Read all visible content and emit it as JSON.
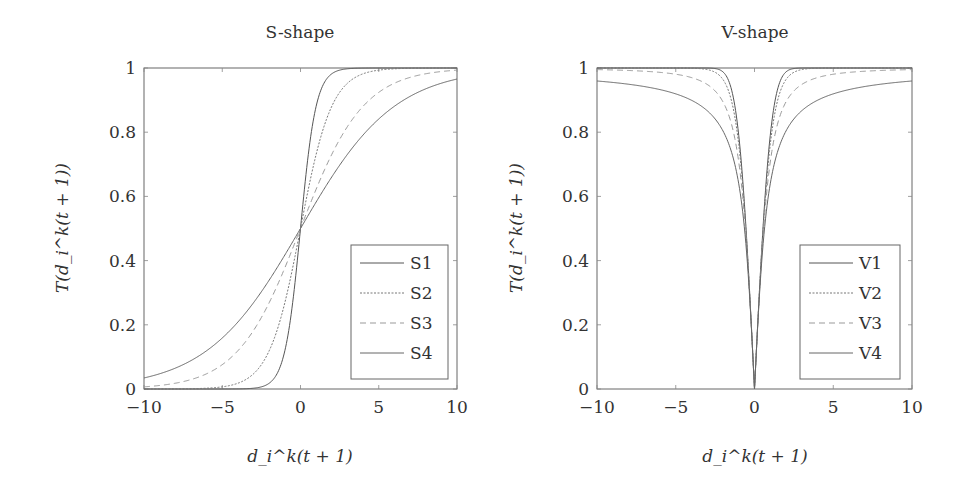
{
  "chart_data": [
    {
      "type": "line",
      "title": "S-shape",
      "xlabel": "d_i^k(t + 1)",
      "ylabel": "T(d_i^k(t + 1))",
      "xlim": [
        -10,
        10
      ],
      "ylim": [
        0,
        1
      ],
      "xticks": [
        -10,
        -5,
        0,
        5,
        10
      ],
      "yticks": [
        0,
        0.2,
        0.4,
        0.6,
        0.8,
        1
      ],
      "xtick_labels": [
        "−10",
        "−5",
        "0",
        "5",
        "10"
      ],
      "ytick_labels": [
        "0",
        "0.2",
        "0.4",
        "0.6",
        "0.8",
        "1"
      ],
      "grid": false,
      "legend_position": "lower right",
      "x": [
        -10,
        -8,
        -6,
        -5,
        -4,
        -3,
        -2,
        -1.5,
        -1,
        -0.5,
        0,
        0.5,
        1,
        1.5,
        2,
        3,
        4,
        5,
        6,
        8,
        10
      ],
      "series": [
        {
          "name": "S1",
          "values": [
            0.0,
            0.0,
            0.0,
            0.0,
            0.0003,
            0.0025,
            0.018,
            0.047,
            0.119,
            0.269,
            0.5,
            0.731,
            0.881,
            0.953,
            0.982,
            0.9975,
            0.9997,
            1.0,
            1.0,
            1.0,
            1.0
          ]
        },
        {
          "name": "S2",
          "values": [
            0.0,
            0.0003,
            0.0025,
            0.0067,
            0.018,
            0.047,
            0.119,
            0.182,
            0.269,
            0.378,
            0.5,
            0.622,
            0.731,
            0.818,
            0.881,
            0.953,
            0.982,
            0.9933,
            0.9975,
            0.9997,
            1.0
          ]
        },
        {
          "name": "S3",
          "values": [
            0.0067,
            0.018,
            0.047,
            0.076,
            0.119,
            0.182,
            0.269,
            0.321,
            0.378,
            0.438,
            0.5,
            0.562,
            0.622,
            0.679,
            0.731,
            0.818,
            0.881,
            0.924,
            0.953,
            0.982,
            0.9933
          ]
        },
        {
          "name": "S4",
          "values": [
            0.034,
            0.065,
            0.119,
            0.159,
            0.209,
            0.269,
            0.339,
            0.378,
            0.417,
            0.458,
            0.5,
            0.542,
            0.583,
            0.622,
            0.661,
            0.731,
            0.791,
            0.841,
            0.881,
            0.935,
            0.966
          ]
        }
      ]
    },
    {
      "type": "line",
      "title": "V-shape",
      "xlabel": "d_i^k(t + 1)",
      "ylabel": "T(d_i^k(t + 1))",
      "xlim": [
        -10,
        10
      ],
      "ylim": [
        0,
        1
      ],
      "xticks": [
        -10,
        -5,
        0,
        5,
        10
      ],
      "yticks": [
        0,
        0.2,
        0.4,
        0.6,
        0.8,
        1
      ],
      "xtick_labels": [
        "−10",
        "−5",
        "0",
        "5",
        "10"
      ],
      "ytick_labels": [
        "0",
        "0.2",
        "0.4",
        "0.6",
        "0.8",
        "1"
      ],
      "grid": false,
      "legend_position": "lower right",
      "x": [
        -10,
        -8,
        -6,
        -5,
        -4,
        -3,
        -2,
        -1.5,
        -1,
        -0.5,
        0,
        0.5,
        1,
        1.5,
        2,
        3,
        4,
        5,
        6,
        8,
        10
      ],
      "series": [
        {
          "name": "V1",
          "values": [
            1.0,
            1.0,
            1.0,
            1.0,
            1.0,
            0.9999,
            0.9857,
            0.9387,
            0.8427,
            0.4883,
            0.0,
            0.4883,
            0.8427,
            0.9387,
            0.9857,
            0.9999,
            1.0,
            1.0,
            1.0,
            1.0,
            1.0
          ]
        },
        {
          "name": "V2",
          "values": [
            1.0,
            1.0,
            1.0,
            0.9999,
            0.9993,
            0.9951,
            0.964,
            0.9051,
            0.7616,
            0.4621,
            0.0,
            0.4621,
            0.7616,
            0.9051,
            0.964,
            0.9951,
            0.9993,
            0.9999,
            1.0,
            1.0,
            1.0
          ]
        },
        {
          "name": "V3",
          "values": [
            0.995,
            0.9923,
            0.9864,
            0.9806,
            0.9701,
            0.9487,
            0.8944,
            0.8321,
            0.7071,
            0.4472,
            0.0,
            0.4472,
            0.7071,
            0.8321,
            0.8944,
            0.9487,
            0.9701,
            0.9806,
            0.9864,
            0.9923,
            0.995
          ]
        },
        {
          "name": "V4",
          "values": [
            0.9598,
            0.9498,
            0.933,
            0.9196,
            0.8996,
            0.8662,
            0.7997,
            0.7351,
            0.6395,
            0.4378,
            0.0,
            0.4378,
            0.6395,
            0.7351,
            0.7997,
            0.8662,
            0.8996,
            0.9196,
            0.933,
            0.9498,
            0.9598
          ]
        }
      ]
    }
  ],
  "panels": [
    {
      "title": "S-shape",
      "legend": [
        "S1",
        "S2",
        "S3",
        "S4"
      ],
      "formulas": [
        "1/(1+exp(-2x))",
        "1/(1+exp(-x))",
        "1/(1+exp(-x/2))",
        "1/(1+exp(-x/3))"
      ]
    },
    {
      "title": "V-shape",
      "legend": [
        "V1",
        "V2",
        "V3",
        "V4"
      ],
      "formulas": [
        "|erf(sqrt(pi)/2 x)|",
        "|tanh(x)|",
        "|x/sqrt(1+x^2)|",
        "|2/pi atan(pi/2 x)|"
      ]
    }
  ],
  "styles": {
    "axis_color": "#666666",
    "text_color": "#333333",
    "series_colors": [
      "#555555",
      "#777777",
      "#999999",
      "#666666"
    ],
    "series_dash": [
      "",
      "2,1.5",
      "6,4",
      ""
    ]
  }
}
